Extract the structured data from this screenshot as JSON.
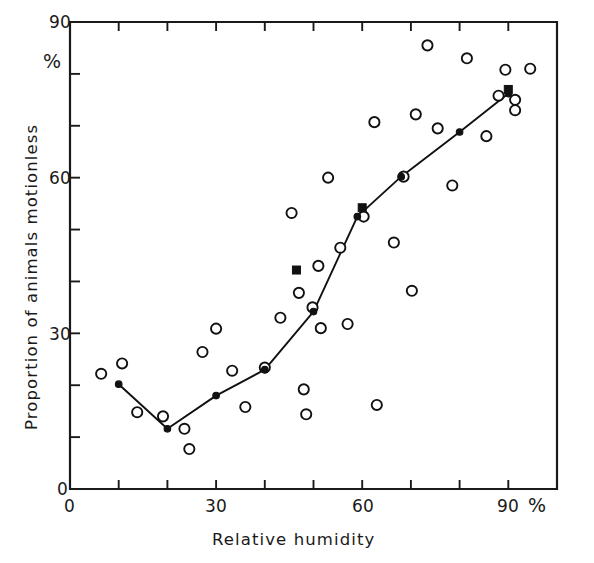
{
  "chart_data": {
    "type": "scatter",
    "title": "",
    "xlabel": "Relative humidity",
    "ylabel": "Proportion of animals motionless",
    "x_unit_label": "%",
    "y_unit_label": "%",
    "xlim": [
      0,
      100
    ],
    "ylim": [
      0,
      90
    ],
    "grid": false,
    "legend": "none",
    "x_ticks_major": [
      0,
      30,
      60,
      90
    ],
    "x_tick_labels": [
      "0",
      "30",
      "60",
      "90"
    ],
    "x_ticks_minor": [
      10,
      20,
      40,
      50,
      70,
      80
    ],
    "y_ticks_major": [
      0,
      30,
      60,
      90
    ],
    "y_tick_labels": [
      "0",
      "30",
      "60",
      "90"
    ],
    "y_ticks_minor": [
      10,
      20,
      40,
      50,
      70,
      80
    ],
    "series": [
      {
        "name": "individual observations",
        "marker": "open-circle",
        "points": [
          [
            6.4,
            22.2
          ],
          [
            10.7,
            24.2
          ],
          [
            13.8,
            14.8
          ],
          [
            19.1,
            14.0
          ],
          [
            23.5,
            11.6
          ],
          [
            24.5,
            7.7
          ],
          [
            27.2,
            26.4
          ],
          [
            30.0,
            30.9
          ],
          [
            33.3,
            22.8
          ],
          [
            36.0,
            15.8
          ],
          [
            40.0,
            23.4
          ],
          [
            43.2,
            33.0
          ],
          [
            45.5,
            53.2
          ],
          [
            47.0,
            37.8
          ],
          [
            48.0,
            19.2
          ],
          [
            48.5,
            14.4
          ],
          [
            49.8,
            35.0
          ],
          [
            51.0,
            43.0
          ],
          [
            51.5,
            31.0
          ],
          [
            53.0,
            60.0
          ],
          [
            55.5,
            46.5
          ],
          [
            57.0,
            31.8
          ],
          [
            60.3,
            52.5
          ],
          [
            62.5,
            70.7
          ],
          [
            63.0,
            16.2
          ],
          [
            66.5,
            47.5
          ],
          [
            68.5,
            60.2
          ],
          [
            70.2,
            38.2
          ],
          [
            71.0,
            72.2
          ],
          [
            73.4,
            85.5
          ],
          [
            75.5,
            69.5
          ],
          [
            78.5,
            58.5
          ],
          [
            81.5,
            83.0
          ],
          [
            85.5,
            68.0
          ],
          [
            88.0,
            75.8
          ],
          [
            89.4,
            80.8
          ],
          [
            91.4,
            75.0
          ],
          [
            91.4,
            73.0
          ],
          [
            94.5,
            81.0
          ]
        ]
      },
      {
        "name": "mean trend",
        "marker": "filled-circle",
        "line": true,
        "points": [
          [
            10.0,
            20.2
          ],
          [
            20.0,
            11.6
          ],
          [
            30.0,
            18.0
          ],
          [
            40.0,
            23.0
          ],
          [
            50.0,
            34.2
          ],
          [
            59.0,
            52.5
          ],
          [
            68.0,
            60.2
          ],
          [
            80.0,
            68.8
          ],
          [
            90.0,
            76.2
          ]
        ]
      },
      {
        "name": "filled-square observations",
        "marker": "filled-square",
        "points": [
          [
            46.5,
            42.2
          ],
          [
            60.0,
            54.2
          ],
          [
            90.0,
            77.0
          ]
        ]
      }
    ]
  },
  "axes": {
    "y_top_label": "90",
    "y_percent": "%",
    "y_mid_label": "60",
    "y_low_label": "30",
    "y_zero_label": "0",
    "x_zero_label": "0",
    "x_30_label": "30",
    "x_60_label": "60",
    "x_90_label": "90",
    "x_percent": "%"
  }
}
